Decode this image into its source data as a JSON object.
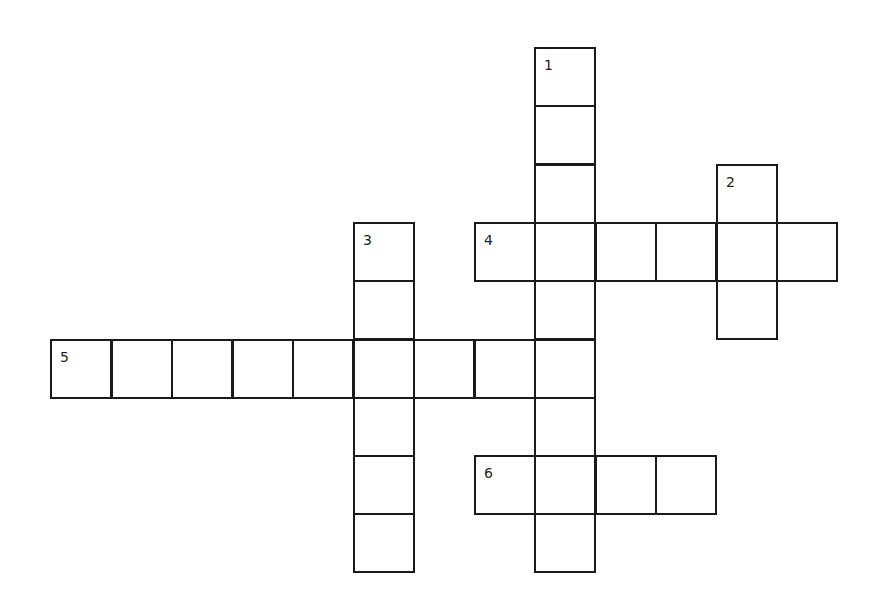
{
  "puzzle": {
    "grid": {
      "origin_x": 50,
      "origin_y": 47,
      "col_step": 60.5,
      "row_step": 58.3,
      "cell_w": 62,
      "cell_h": 60,
      "line_color": "#1a1a1a"
    },
    "entries": [
      {
        "number": "1",
        "direction": "down",
        "row": 0,
        "col": 8,
        "length": 9
      },
      {
        "number": "2",
        "direction": "down",
        "row": 2,
        "col": 11,
        "length": 3
      },
      {
        "number": "3",
        "direction": "down",
        "row": 3,
        "col": 5,
        "length": 6
      },
      {
        "number": "4",
        "direction": "across",
        "row": 3,
        "col": 7,
        "length": 6
      },
      {
        "number": "5",
        "direction": "across",
        "row": 5,
        "col": 0,
        "length": 9
      },
      {
        "number": "6",
        "direction": "across",
        "row": 7,
        "col": 7,
        "length": 4
      }
    ]
  }
}
